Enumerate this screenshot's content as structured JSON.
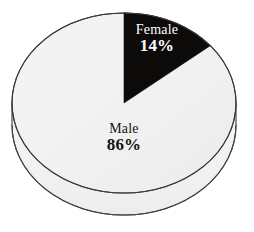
{
  "chart_data": {
    "type": "pie",
    "title": "",
    "subtitle": "",
    "xlabel": "",
    "ylabel": "",
    "legend": "none",
    "three_d": true,
    "categories": [
      "Female",
      "Male"
    ],
    "values": [
      14,
      86
    ],
    "value_unit": "%",
    "slices": [
      {
        "label": "Female",
        "value": 14,
        "value_text": "14%",
        "color": "#0d0b0a",
        "label_color": "#ffffff",
        "start_angle_deg": 0,
        "sweep_deg": 50.4
      },
      {
        "label": "Male",
        "value": 86,
        "value_text": "86%",
        "color": "#f1f1f1",
        "label_color": "#16120f",
        "start_angle_deg": 50.4,
        "sweep_deg": 309.6
      }
    ],
    "geometry": {
      "center_x": 124,
      "center_y": 103,
      "radius_x": 112,
      "radius_y": 90,
      "depth": 22
    },
    "style": {
      "background": "#ffffff",
      "outline": "#3c3a39",
      "side_wall": "#f4f4f4",
      "slice_light": "#f1f1f1",
      "slice_dark": "#0d0b0a"
    }
  },
  "labels": {
    "female": {
      "name": "Female",
      "value": "14%"
    },
    "male": {
      "name": "Male",
      "value": "86%"
    }
  }
}
